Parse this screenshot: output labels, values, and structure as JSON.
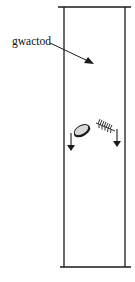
{
  "diagram": {
    "title": "",
    "label": {
      "text": "gwactod",
      "meaning": "vacuum"
    },
    "objects": [
      {
        "name": "coin",
        "motion": "falling"
      },
      {
        "name": "feather",
        "motion": "falling"
      }
    ],
    "colors": {
      "stroke": "#1a1a1a",
      "coin_fill": "#d8d8d8",
      "background": "#ffffff"
    }
  }
}
